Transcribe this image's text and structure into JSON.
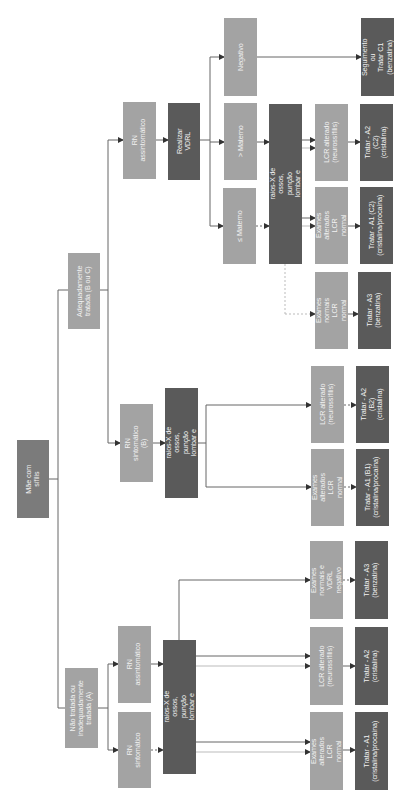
{
  "diagram": {
    "title": "Mãe com sífilis",
    "colors": {
      "light_box": "#a3a3a3",
      "mid_box": "#7b7b7b",
      "dark_box": "#5a5a5a",
      "line": "#555555",
      "text": "#f2f2f2"
    },
    "nodes": {
      "root": "Mãe com sífilis",
      "untreated": "Não tratada ou\ninadequadamente\ntratada (A)",
      "treated": "Adequadamente\ntratada (B ou C)",
      "a_symptomatic": "RN sintomático",
      "a_asymptomatic": "RN assintomático",
      "a_exams": "Realizar raios-X de ossos, punção\nlombar e hemograma",
      "b_symptomatic": "RN sintomático\n(B)",
      "b_exams": "Realizar raios-X de ossos,\npunção lombar e hemograma",
      "c_asymptomatic": "RN assintomático",
      "c_vdrl": "Realizar VDRL",
      "c_le_maternal": "≤ Materno",
      "c_gt_maternal": "> Materno",
      "c_negative": "Negativo",
      "c_exams": "Realizar raios-X de ossos, punção\nlombar e hemograma",
      "c_follow": "Seguimento ou\nTratar C1\n(benzatina)",
      "c_lcr_altered": "LCR alterado\n(neurossífilis)",
      "c_treat_a2": "Tratar - A2 (C2)\n(cristalina)",
      "c_exams_altered": "Exames alterados\nLCR normal",
      "c_treat_a1": "Tratar - A1 (C2)\n(cristalina/procaína)",
      "c_exams_normal": "Exames normais\nLCR normal",
      "c_treat_a3": "Tratar - A3\n(benzatina)",
      "b_lcr_altered": "LCR alterado\n(neurossífilis)",
      "b_treat_a2": "Tratar - A2 (B2)\n(cristalina)",
      "b_exams_altered": "Exames alterados\nLCR normal",
      "b_treat_a1": "Tratar - A1 (B1)\n(cristalina/procaína)",
      "a_exams_normal": "Exames normais e\nVDRL negativo",
      "a_treat_a3": "Tratar - A3\n(benzatina)",
      "a_lcr_altered": "LCR alterado\n(neurossífilis)",
      "a_treat_a2": "Tratar - A2\n(cristalina)",
      "a_exams_altered": "Exames alterados\nLCR normal",
      "a_treat_a1": "Tratar - A1\n(cristalina/procaína)"
    }
  }
}
